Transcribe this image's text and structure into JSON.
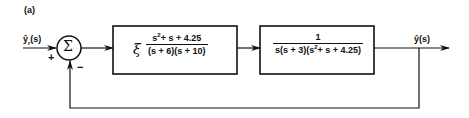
{
  "panel_label": "(a)",
  "input": {
    "label": "ŷr(s)",
    "label_main": "ŷ",
    "label_sub": "r",
    "label_arg": "(s)",
    "sign": "+"
  },
  "summing_junction": {
    "symbol": "Σ",
    "feedback_sign": "−"
  },
  "controller": {
    "gain_symbol": "ξ",
    "numerator": "s²+ s + 4.25",
    "numerator_base": "s",
    "numerator_exp": "2",
    "numerator_rest": "+ s + 4.25",
    "denominator": "(s + 6)(s + 10)"
  },
  "plant": {
    "numerator": "1",
    "denominator": "s(s + 3)(s²+ s + 4.25)",
    "denominator_pre": "s(s + 3)(s",
    "denominator_exp": "2",
    "denominator_post": "+ s + 4.25)"
  },
  "output": {
    "label": "ŷ(s)"
  },
  "colors": {
    "line": "#111111",
    "background": "#ffffff"
  }
}
